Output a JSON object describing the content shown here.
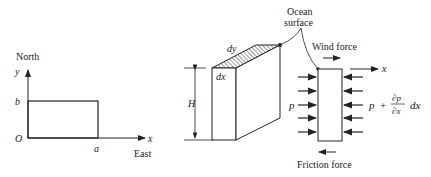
{
  "panel_left": {
    "axis_y_direction": "North",
    "axis_x_direction": "East",
    "y_axis_label": "y",
    "x_axis_label": "x",
    "origin_label": "O",
    "b_label": "b",
    "a_label": "a"
  },
  "panel_block": {
    "top_depth_label": "dy",
    "top_width_label": "dx",
    "height_label": "H"
  },
  "panel_forces": {
    "ocean_surface_line1": "Ocean",
    "ocean_surface_line2": "surface",
    "wind_force_label": "Wind force",
    "x_axis_label": "x",
    "left_pressure_label": "p",
    "right_pressure_p": "p",
    "right_pressure_plus": "+",
    "right_pressure_num": "∂p",
    "right_pressure_den": "∂x",
    "right_pressure_dx": "dx",
    "friction_force_label": "Friction force"
  },
  "colors": {
    "ink": "#222222",
    "background": "#ffffff"
  }
}
